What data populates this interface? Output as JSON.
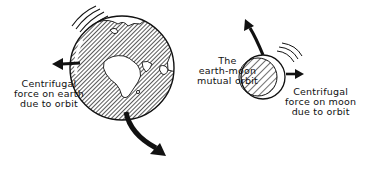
{
  "diagram": {
    "colors": {
      "ink": "#111111",
      "background": "#ffffff"
    },
    "labels": {
      "earth_force": [
        "Centrifugal",
        "force on earth",
        "due to orbit"
      ],
      "mutual_orbit": [
        "The",
        "earth-moon",
        "mutual orbit"
      ],
      "moon_force": [
        "Centrifugal",
        "force on moon",
        "due to orbit"
      ]
    },
    "elements": {
      "earth": {
        "shape": "globe",
        "cx": 122,
        "cy": 68,
        "r": 52,
        "fill": "hatched",
        "continents": "Europe, Africa, Asia"
      },
      "moon": {
        "shape": "circle",
        "cx": 263,
        "cy": 77,
        "r": 22,
        "fill": "hatched",
        "crescent": "right"
      },
      "arrows": [
        {
          "name": "earth-centrifugal-arrow",
          "direction": "left"
        },
        {
          "name": "earth-orbit-arrow",
          "direction": "down-right (curved)"
        },
        {
          "name": "moon-orbit-arrow",
          "direction": "up-left (curved)"
        },
        {
          "name": "moon-centrifugal-arrow",
          "direction": "right"
        }
      ],
      "motion_lines": [
        "earth upper-left",
        "moon upper-right"
      ]
    }
  }
}
